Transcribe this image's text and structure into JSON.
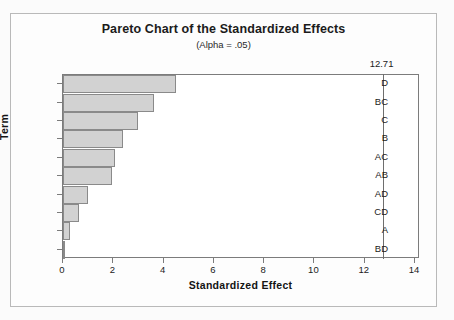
{
  "chart_data": {
    "type": "bar",
    "orientation": "horizontal",
    "title": "Pareto Chart of the Standardized Effects",
    "subtitle": "(Alpha = .05)",
    "xlabel": "Standardized Effect",
    "ylabel": "Term",
    "categories": [
      "D",
      "BC",
      "C",
      "B",
      "AC",
      "AB",
      "AD",
      "CD",
      "A",
      "BD"
    ],
    "values": [
      4.5,
      3.6,
      3.0,
      2.4,
      2.07,
      1.95,
      1.0,
      0.65,
      0.28,
      0.02
    ],
    "xlim": [
      0,
      14.2
    ],
    "xticks": [
      0,
      2,
      4,
      6,
      8,
      10,
      12,
      14
    ],
    "xtick_labels": [
      "0",
      "2",
      "4",
      "6",
      "8",
      "10",
      "12",
      "14"
    ],
    "grid": false,
    "legend": null,
    "reference_line": {
      "value": 12.71,
      "label": "12.71",
      "orientation": "vertical"
    },
    "bar_fill_color": "#d2d2d2",
    "bar_border_color": "#8a8a8a",
    "axis_color": "#7c7c7c",
    "text_color": "#1b1b1b",
    "plot_background": "#ffffff",
    "figure_background": "#fdfdfd"
  }
}
